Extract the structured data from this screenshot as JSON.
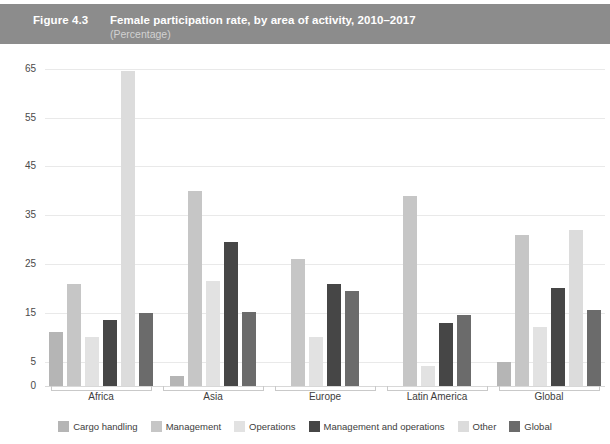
{
  "header": {
    "figure_number": "Figure 4.3",
    "title": "Female participation rate, by area of activity, 2010–2017",
    "subtitle": "(Percentage)",
    "band_color": "#8c8c8c",
    "title_color": "#ffffff",
    "subtitle_color": "#d2d2d2"
  },
  "chart_data": {
    "type": "bar",
    "title": "Female participation rate, by area of activity, 2010–2017",
    "subtitle": "(Percentage)",
    "xlabel": "",
    "ylabel": "",
    "ylim": [
      0,
      68
    ],
    "yticks": [
      0,
      5,
      15,
      25,
      35,
      45,
      55,
      65
    ],
    "ytick_labels": [
      "0",
      "5",
      "15",
      "25",
      "35",
      "45",
      "55",
      "65"
    ],
    "grid": true,
    "legend_position": "bottom",
    "categories": [
      "Africa",
      "Asia",
      "Europe",
      "Latin America",
      "Global"
    ],
    "series": [
      {
        "name": "Cargo handling",
        "color": "#b5b5b5",
        "values": [
          11.0,
          2.0,
          null,
          null,
          5.0
        ]
      },
      {
        "name": "Management",
        "color": "#c6c6c6",
        "values": [
          21.0,
          40.0,
          26.0,
          39.0,
          31.0
        ]
      },
      {
        "name": "Operations",
        "color": "#e2e2e2",
        "values": [
          10.0,
          21.5,
          10.0,
          4.0,
          12.0
        ]
      },
      {
        "name": "Management and operations",
        "color": "#464646",
        "values": [
          13.5,
          29.5,
          21.0,
          13.0,
          20.0
        ]
      },
      {
        "name": "Other",
        "color": "#dcdcdc",
        "values": [
          64.5,
          null,
          null,
          null,
          32.0
        ]
      },
      {
        "name": "Global",
        "color": "#6b6b6b",
        "values": [
          15.0,
          15.2,
          19.5,
          14.5,
          15.5
        ]
      }
    ]
  },
  "legend": {
    "items": [
      {
        "label": "Cargo handling",
        "color": "#b5b5b5"
      },
      {
        "label": "Management",
        "color": "#c6c6c6"
      },
      {
        "label": "Operations",
        "color": "#e2e2e2"
      },
      {
        "label": "Management and operations",
        "color": "#464646"
      },
      {
        "label": "Other",
        "color": "#dcdcdc"
      },
      {
        "label": "Global",
        "color": "#6b6b6b"
      }
    ]
  }
}
